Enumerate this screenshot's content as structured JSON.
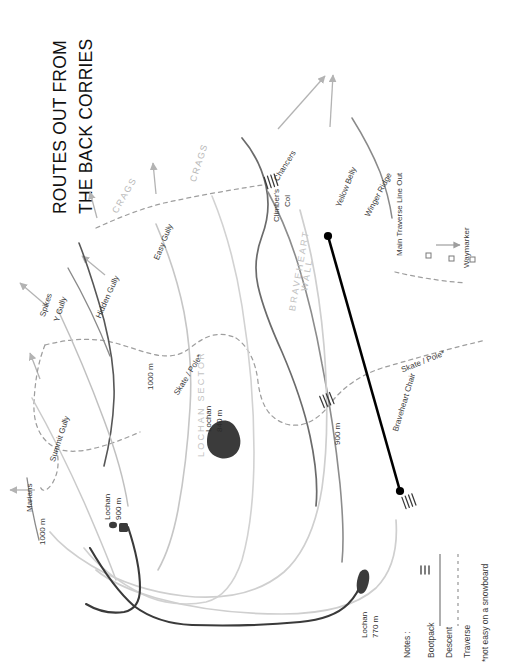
{
  "title": {
    "line1": "ROUTES OUT FROM",
    "line2": "THE BACK CORRIES"
  },
  "map": {
    "features": [
      {
        "name": "spikes",
        "label": "Spikes"
      },
      {
        "name": "y-gully",
        "label": "Y Gully"
      },
      {
        "name": "hidden-gully",
        "label": "Hidden Gully"
      },
      {
        "name": "easy-gully",
        "label": "Easy Gully"
      },
      {
        "name": "summit-gully",
        "label": "Summit Gully"
      },
      {
        "name": "marians",
        "label": "Marians"
      },
      {
        "name": "chancers",
        "label": "Chancers"
      },
      {
        "name": "climbers-col",
        "label": "Climber's\nCol"
      },
      {
        "name": "yellow-belly",
        "label": "Yellow Belly"
      },
      {
        "name": "winger-ridge",
        "label": "Winger Ridge"
      },
      {
        "name": "braveheart-chair",
        "label": "Braveheart Chair"
      },
      {
        "name": "main-traverse-line-out",
        "label": "Main Traverse Line Out"
      },
      {
        "name": "waymarker",
        "label": "Waymarker"
      }
    ],
    "labels": {
      "spikes": "Spikes",
      "y_gully": "Y Gully",
      "hidden_gully": "Hidden Gully",
      "easy_gully": "Easy Gully",
      "summit_gully": "Summit Gully",
      "marians": "Marians",
      "chancers": "Chancers",
      "climbers_col_1": "Climber's",
      "climbers_col_2": "Col",
      "yellow_belly": "Yellow Belly",
      "winger_ridge": "Winger Ridge",
      "braveheart_chair": "Braveheart Chair",
      "main_traverse_line_out": "Main Traverse Line Out",
      "waymarker": "Waymarker",
      "crags_left": "CRAGS",
      "crags_right": "CRAGS",
      "braveheart_wall_1": "BRAVEHEART",
      "braveheart_wall_2": "WALL",
      "lochan_sector": "LOCHAN SECTOR",
      "skate_pole_left": "Skate / Pole*",
      "skate_pole_right": "Skate / Pole*",
      "contour_1000_left": "1000 m",
      "contour_1000_mid": "1000 m",
      "contour_900": "900 m",
      "lochan_840_a": "Lochan",
      "lochan_840_b": "840 m",
      "lochan_900_a": "Lochan",
      "lochan_900_b": "900 m",
      "lochan_770_a": "Lochan",
      "lochan_770_b": "770 m"
    }
  },
  "legend": {
    "heading": "Notes :",
    "items": [
      {
        "name": "bootpack",
        "label": "Bootpack",
        "style": "tick-marks"
      },
      {
        "name": "descent",
        "label": "Descent",
        "style": "solid-line"
      },
      {
        "name": "traverse",
        "label": "Traverse",
        "style": "dashed-line"
      }
    ],
    "items_flat": {
      "bootpack": "Bootpack",
      "descent": "Descent",
      "traverse": "Traverse"
    },
    "footnote": "*not easy on a snowboard"
  },
  "colors": {
    "bootpack": "#000000",
    "descent_dark": "#3d3d3d",
    "descent_mid": "#6f6f6f",
    "descent_light": "#b9b9b9",
    "traverse": "#9a9a9a",
    "crags_text": "#c4c4c4",
    "lochan_fill": "#3b3b3b",
    "title_text": "#111111",
    "label_text": "#3b3b3b"
  }
}
